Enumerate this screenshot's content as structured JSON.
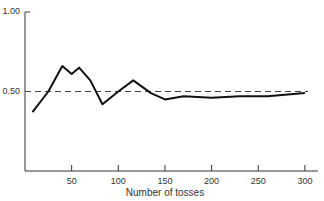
{
  "chart_data": {
    "type": "line",
    "title": "",
    "xlabel": "Number of tosses",
    "ylabel": "",
    "xlim": [
      0,
      310
    ],
    "ylim": [
      0,
      1.0
    ],
    "x_ticks": [
      50,
      100,
      150,
      200,
      250,
      300
    ],
    "x_tick_labels": [
      "50",
      "100",
      "150",
      "200",
      "250",
      "300"
    ],
    "y_ticks": [
      0.5,
      1.0
    ],
    "y_tick_labels": [
      "0.50",
      "1.00"
    ],
    "grid": false,
    "reference_line": {
      "y": 0.5,
      "style": "dashed"
    },
    "series": [
      {
        "name": "Proportion of heads",
        "x": [
          8,
          25,
          40,
          50,
          58,
          70,
          83,
          100,
          116,
          135,
          150,
          170,
          200,
          230,
          260,
          300
        ],
        "values": [
          0.37,
          0.5,
          0.66,
          0.61,
          0.65,
          0.57,
          0.42,
          0.5,
          0.57,
          0.49,
          0.45,
          0.47,
          0.46,
          0.47,
          0.47,
          0.49
        ]
      }
    ]
  }
}
